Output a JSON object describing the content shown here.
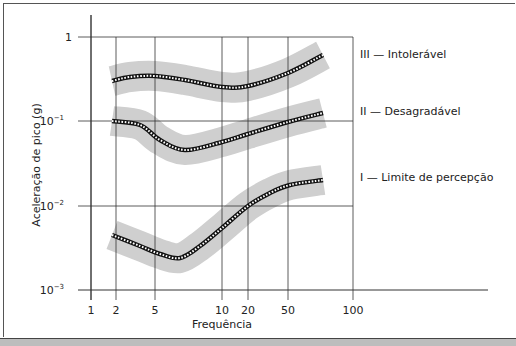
{
  "chart_data": {
    "type": "line",
    "title": "",
    "xlabel": "Frequência",
    "ylabel": "Aceleração de pico (g)",
    "xscale": "log",
    "yscale": "log",
    "x_ticks": [
      {
        "value": 1,
        "label": "1",
        "px": 91
      },
      {
        "value": 2,
        "label": "2",
        "px": 116
      },
      {
        "value": 5,
        "label": "5",
        "px": 155
      },
      {
        "value": 10,
        "label": "10",
        "px": 222
      },
      {
        "value": 20,
        "label": "20",
        "px": 248
      },
      {
        "value": 50,
        "label": "50",
        "px": 288
      },
      {
        "value": 100,
        "label": "100",
        "px": 353
      }
    ],
    "y_ticks": [
      {
        "value": 1,
        "label": "1",
        "sup": "",
        "px": 37
      },
      {
        "value": 0.1,
        "label": "10",
        "sup": "−1",
        "px": 121
      },
      {
        "value": 0.01,
        "label": "10",
        "sup": "−2",
        "px": 206
      },
      {
        "value": 0.001,
        "label": "10",
        "sup": "−3",
        "px": 290
      }
    ],
    "ylim": [
      0.001,
      1
    ],
    "xlim": [
      1,
      100
    ],
    "grid": true,
    "legend_position": "right, inline labels",
    "series": [
      {
        "name": "III — Intolerável",
        "label_y": 58,
        "x": [
          1.8,
          2.5,
          5,
          7,
          10,
          20,
          50,
          70
        ],
        "values": [
          0.3,
          0.33,
          0.34,
          0.31,
          0.26,
          0.26,
          0.38,
          0.62
        ],
        "px": [
          [
            112,
            81
          ],
          [
            130,
            77
          ],
          [
            155,
            76
          ],
          [
            185,
            80
          ],
          [
            222,
            87
          ],
          [
            248,
            86
          ],
          [
            288,
            73
          ],
          [
            323,
            55
          ]
        ]
      },
      {
        "name": "II — Desagradável",
        "label_y": 115,
        "x": [
          1.8,
          3,
          5.5,
          7,
          10,
          20,
          50,
          70
        ],
        "values": [
          0.1,
          0.09,
          0.06,
          0.047,
          0.058,
          0.072,
          0.1,
          0.13
        ],
        "px": [
          [
            112,
            121
          ],
          [
            140,
            125
          ],
          [
            160,
            140
          ],
          [
            185,
            150
          ],
          [
            222,
            142
          ],
          [
            248,
            134
          ],
          [
            288,
            122
          ],
          [
            323,
            113
          ]
        ]
      },
      {
        "name": "I — Limite de percepção",
        "label_y": 181,
        "x": [
          1.8,
          3,
          5.5,
          6.5,
          8,
          10,
          20,
          30,
          50,
          70
        ],
        "values": [
          0.005,
          0.0037,
          0.003,
          0.0027,
          0.0037,
          0.006,
          0.01,
          0.014,
          0.018,
          0.02
        ],
        "px": [
          [
            112,
            235
          ],
          [
            140,
            246
          ],
          [
            160,
            254
          ],
          [
            180,
            258
          ],
          [
            200,
            246
          ],
          [
            222,
            228
          ],
          [
            248,
            206
          ],
          [
            270,
            193
          ],
          [
            290,
            185
          ],
          [
            323,
            180
          ]
        ]
      }
    ]
  },
  "colors": {
    "band": "#cfcfcf",
    "curve": "#111111",
    "curve_dash": "#ffffff",
    "grid": "#333333",
    "strip": "#bdbdbd"
  }
}
